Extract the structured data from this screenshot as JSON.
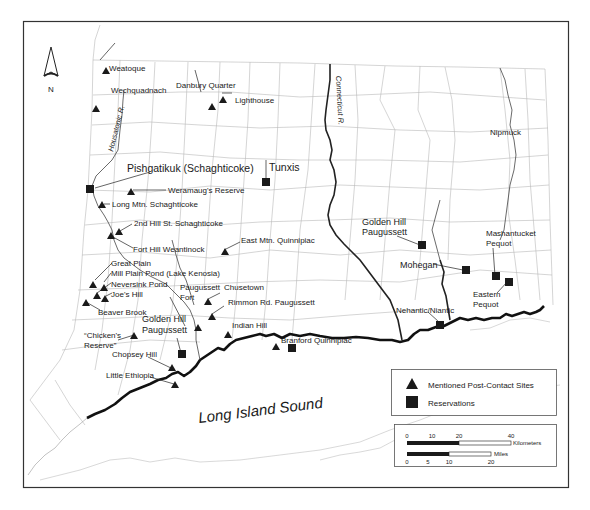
{
  "page_header": "Native Americans of the Northeastern United States",
  "compass": {
    "label": "N"
  },
  "rivers": [
    {
      "id": "housatonic",
      "label": "Housatonic R."
    },
    {
      "id": "connecticut",
      "label": "Connecticut R."
    }
  ],
  "water_body": {
    "label": "Long Island Sound"
  },
  "post_contact_sites": [
    {
      "label": "Weatoque"
    },
    {
      "label": "Wechquadnach"
    },
    {
      "label": "Danbury Quarter"
    },
    {
      "label": "Lighthouse"
    },
    {
      "label": "Weramaug's Reserve"
    },
    {
      "label": "Long Mtn. Schaghticoke"
    },
    {
      "label": "2nd Hill St. Schaghticoke"
    },
    {
      "label": "Fort Hill Weantinock"
    },
    {
      "label": "East Mtn. Quinnipiac"
    },
    {
      "label": "Great Plain"
    },
    {
      "label": "Mill Plain Pond (Lake Kenosia)"
    },
    {
      "label": "Neversink Pond"
    },
    {
      "label": "Joe's Hill"
    },
    {
      "label": "Beaver Brook"
    },
    {
      "label": "Paugussett"
    },
    {
      "label": "Fort"
    },
    {
      "label": "Chusetown"
    },
    {
      "label": "Rimmon Rd. Paugussett"
    },
    {
      "label": "Indian Hill"
    },
    {
      "label": "“Chicken's"
    },
    {
      "label": "Reserve”"
    },
    {
      "label": "Chopsey Hill"
    },
    {
      "label": "Little Ethiopia"
    },
    {
      "label": "Branford Quinnipiac"
    },
    {
      "label": "Nipmuck"
    },
    {
      "label": "Nehantic/Niantic"
    }
  ],
  "reservations": [
    {
      "label": "Pishgatikuk (Schaghticoke)"
    },
    {
      "label": "Tunxis"
    },
    {
      "label": "Golden Hill"
    },
    {
      "label": "Paugussett"
    },
    {
      "label": "Golden Hill"
    },
    {
      "label": "Paugussett"
    },
    {
      "label": "Mohegan"
    },
    {
      "label": "Mashantucket"
    },
    {
      "label": "Pequot"
    },
    {
      "label": "Eastern"
    },
    {
      "label": "Pequot"
    }
  ],
  "legend": {
    "items": [
      {
        "symbol": "triangle",
        "label": "Mentioned Post-Contact Sites"
      },
      {
        "symbol": "square",
        "label": "Reservations"
      }
    ]
  },
  "scale_bar": {
    "km": {
      "ticks": [
        "0",
        "10",
        "20",
        "40"
      ],
      "unit": "Kilometers"
    },
    "miles": {
      "ticks": [
        "0",
        "5",
        "10",
        "20"
      ],
      "unit": "Miles"
    }
  },
  "colors": {
    "symbol": "#1a1a1a",
    "town_lines": "#b8b8b8",
    "frame": "#333333"
  }
}
